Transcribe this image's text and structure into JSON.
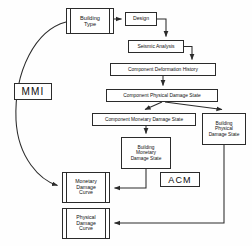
{
  "diagram": {
    "canvas": {
      "width": 252,
      "height": 246
    },
    "stroke_color": "#2b2b2b",
    "text_color": "#111111",
    "background": "#fefefe",
    "nodes": [
      {
        "id": "building-type",
        "label": "Building\nType",
        "x": 66,
        "y": 8,
        "w": 48,
        "h": 26,
        "font_size": 5.6,
        "style": "rail"
      },
      {
        "id": "design",
        "label": "Design",
        "x": 125,
        "y": 12,
        "w": 32,
        "h": 14,
        "font_size": 5.2,
        "style": "plain"
      },
      {
        "id": "seismic-analysis",
        "label": "Seismic Analysis",
        "x": 128,
        "y": 40,
        "w": 56,
        "h": 13,
        "font_size": 5.0,
        "style": "plain"
      },
      {
        "id": "component-deformation-history",
        "label": "Component Deformation History",
        "x": 110,
        "y": 63,
        "w": 106,
        "h": 13,
        "font_size": 4.9,
        "style": "plain"
      },
      {
        "id": "component-physical-damage-state",
        "label": "Component Physical Damage State",
        "x": 106,
        "y": 89,
        "w": 112,
        "h": 13,
        "font_size": 4.9,
        "style": "plain"
      },
      {
        "id": "component-monetary-damage-state",
        "label": "Component Monetary Damage State",
        "x": 92,
        "y": 113,
        "w": 104,
        "h": 13,
        "font_size": 4.8,
        "style": "plain"
      },
      {
        "id": "building-physical-damage-state",
        "label": "Building\nPhysical\nDamage State",
        "x": 202,
        "y": 113,
        "w": 44,
        "h": 32,
        "font_size": 4.8,
        "style": "plain"
      },
      {
        "id": "building-monetary-damage-state",
        "label": "Building\nMonetary\nDamage State",
        "x": 121,
        "y": 137,
        "w": 50,
        "h": 32,
        "font_size": 4.8,
        "style": "plain"
      },
      {
        "id": "monetary-damage-curve",
        "label": "Monetary\nDamage\nCurve",
        "x": 62,
        "y": 172,
        "w": 48,
        "h": 31,
        "font_size": 5.2,
        "style": "rail"
      },
      {
        "id": "physical-damage-curve",
        "label": "Physical\nDamage\nCurve",
        "x": 62,
        "y": 208,
        "w": 48,
        "h": 31,
        "font_size": 5.2,
        "style": "rail"
      }
    ],
    "tags": [
      {
        "id": "mmi-tag",
        "label": "MMI",
        "x": 14,
        "y": 83,
        "w": 38,
        "h": 17,
        "font_size": 10
      },
      {
        "id": "acm-tag",
        "label": "ACM",
        "x": 160,
        "y": 172,
        "w": 40,
        "h": 15,
        "font_size": 9
      }
    ],
    "connectors": [
      {
        "id": "building-type-to-design",
        "from": "building-type",
        "to": "design",
        "kind": "straight-right"
      },
      {
        "id": "design-to-seismic-analysis",
        "from": "design",
        "to": "seismic-analysis",
        "kind": "elbow-right-down"
      },
      {
        "id": "seismic-analysis-to-component-deformation-history",
        "from": "seismic-analysis",
        "to": "component-deformation-history",
        "kind": "elbow-right-down"
      },
      {
        "id": "component-deformation-history-to-component-physical-damage-state",
        "from": "component-deformation-history",
        "to": "component-physical-damage-state",
        "kind": "straight-down"
      },
      {
        "id": "component-physical-damage-state-to-component-monetary-damage-state",
        "from": "component-physical-damage-state",
        "to": "component-monetary-damage-state",
        "kind": "diagonal-left-down"
      },
      {
        "id": "component-physical-damage-state-to-building-physical-damage-state",
        "from": "component-physical-damage-state",
        "to": "building-physical-damage-state",
        "kind": "diagonal-right-down"
      },
      {
        "id": "component-monetary-damage-state-to-building-monetary-damage-state",
        "from": "component-monetary-damage-state",
        "to": "building-monetary-damage-state",
        "kind": "straight-down"
      },
      {
        "id": "building-monetary-damage-state-to-monetary-damage-curve",
        "from": "building-monetary-damage-state",
        "to": "monetary-damage-curve",
        "kind": "elbow-down-left"
      },
      {
        "id": "building-physical-damage-state-to-physical-damage-curve",
        "from": "building-physical-damage-state",
        "to": "physical-damage-curve",
        "kind": "elbow-down-left"
      },
      {
        "id": "mmi-arc-building-type-to-monetary-damage-curve",
        "from": "building-type",
        "to": "monetary-damage-curve",
        "kind": "arc-left"
      }
    ]
  }
}
